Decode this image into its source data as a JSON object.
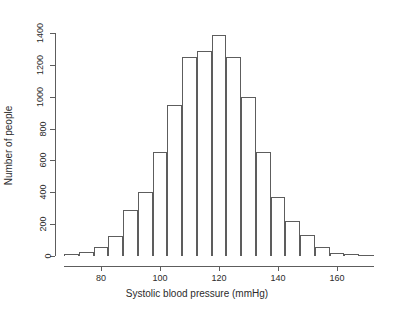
{
  "chart_data": {
    "type": "bar",
    "title": "",
    "subtitle": "",
    "xlabel": "Systolic blood pressure (mmHg)",
    "ylabel": "Number of people",
    "grid": false,
    "legend": null,
    "xlim": [
      65,
      176
    ],
    "ylim": [
      0,
      1400
    ],
    "xticks": [
      80,
      100,
      120,
      140,
      160
    ],
    "xtick_labels": [
      "80",
      "100",
      "120",
      "140",
      "160"
    ],
    "yticks": [
      0,
      200,
      400,
      600,
      800,
      1000,
      1200,
      1400
    ],
    "ytick_labels": [
      "0",
      "200",
      "400",
      "600",
      "800",
      "1000",
      "1200",
      "1400"
    ],
    "bin_width": 5,
    "bin_edges": [
      67.5,
      72.5,
      77.5,
      82.5,
      87.5,
      92.5,
      97.5,
      102.5,
      107.5,
      112.5,
      117.5,
      122.5,
      127.5,
      132.5,
      137.5,
      142.5,
      147.5,
      152.5,
      157.5,
      162.5,
      167.5,
      172.5
    ],
    "categories": [
      "67.5-72.5",
      "72.5-77.5",
      "77.5-82.5",
      "82.5-87.5",
      "87.5-92.5",
      "92.5-97.5",
      "97.5-102.5",
      "102.5-107.5",
      "107.5-112.5",
      "112.5-117.5",
      "117.5-122.5",
      "122.5-127.5",
      "127.5-132.5",
      "132.5-137.5",
      "137.5-142.5",
      "142.5-147.5",
      "147.5-152.5",
      "152.5-157.5",
      "157.5-162.5",
      "162.5-167.5",
      "167.5-172.5"
    ],
    "values": [
      10,
      25,
      55,
      125,
      290,
      400,
      650,
      950,
      1250,
      1290,
      1390,
      1250,
      1000,
      650,
      370,
      220,
      130,
      55,
      20,
      10,
      5
    ],
    "bar_fill": "#ffffff",
    "bar_border": "#5d5d5d",
    "axis_color": "#5d5d5d",
    "background": "#ffffff"
  }
}
